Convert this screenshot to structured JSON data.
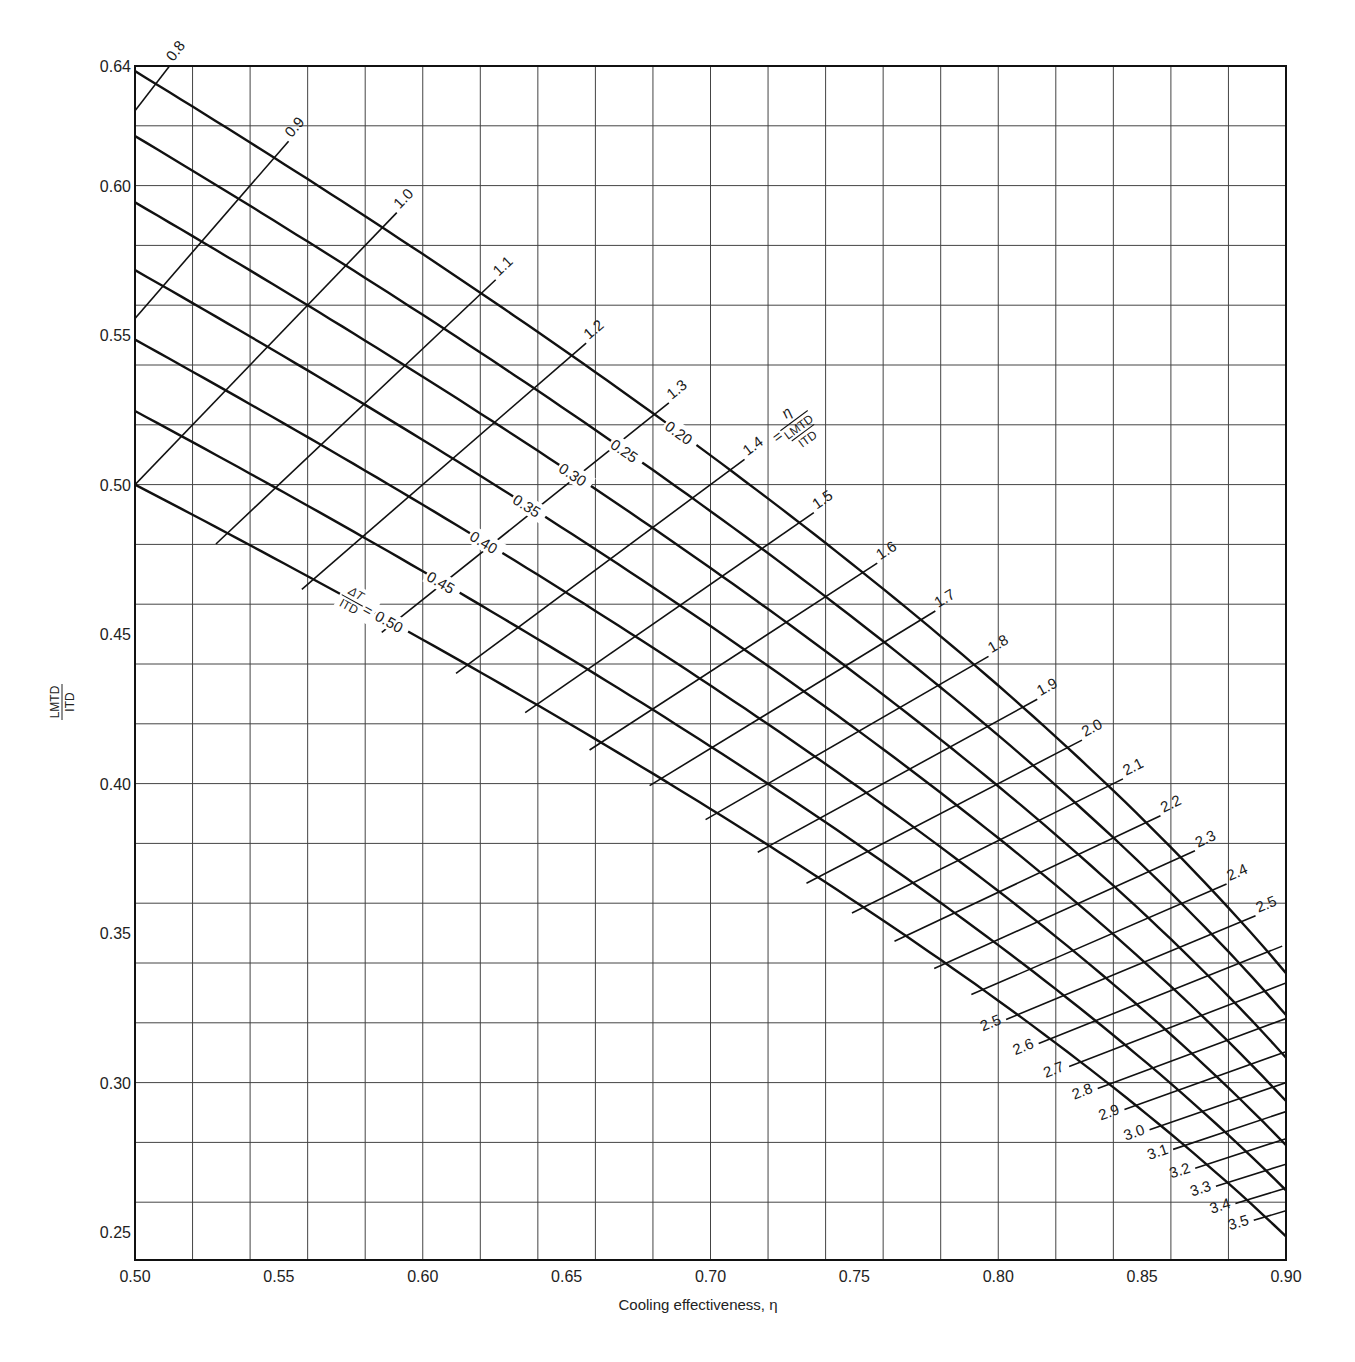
{
  "chart_data": {
    "type": "line",
    "title": "",
    "xlabel": "Cooling effectiveness, η",
    "ylabel": "LMTD / ITD",
    "ylabel_numerator": "LMTD",
    "ylabel_denominator": "ITD",
    "xlim": [
      0.5,
      0.9
    ],
    "ylim": [
      0.2406,
      0.64
    ],
    "grid": true,
    "x_grid_step": 0.02,
    "y_grid_step": 0.02,
    "x_ticks": [
      "0.50",
      "0.55",
      "0.60",
      "0.65",
      "0.70",
      "0.75",
      "0.80",
      "0.85",
      "0.90"
    ],
    "y_ticks": [
      "0.64",
      "0.60",
      "0.55",
      "0.50",
      "0.45",
      "0.40",
      "0.35",
      "0.30",
      "0.25"
    ],
    "legend": "none",
    "relation": "LMTD/ITD = (η − ΔT/ITD) / ln((1 − ΔT/ITD)/(1 − η))",
    "family_dt": {
      "parameter": "ΔT/ITD",
      "prefix_label_numerator": "ΔT",
      "prefix_label_denominator": "ITD",
      "values": [
        0.2,
        0.25,
        0.3,
        0.35,
        0.4,
        0.45,
        0.5
      ],
      "labels": [
        "0.20",
        "0.25",
        "0.30",
        "0.35",
        "0.40",
        "0.45",
        "0.50"
      ],
      "label_eta": [
        0.685,
        0.666,
        0.648,
        0.632,
        0.617,
        0.602,
        0.584
      ],
      "start_values_at_eta_0_50": [
        0.638,
        0.616,
        0.594,
        0.571,
        0.548,
        0.524,
        0.5
      ],
      "end_values_at_eta_0_90": [
        0.337,
        0.322,
        0.308,
        0.293,
        0.279,
        0.263,
        0.249
      ]
    },
    "family_ntu": {
      "parameter": "η / (LMTD/ITD)",
      "equation_label": "1.4 =",
      "equation_numerator": "η",
      "equation_den_top": "LMTD",
      "equation_den_bottom": "ITD",
      "values": [
        0.8,
        0.9,
        1.0,
        1.1,
        1.2,
        1.3,
        1.4,
        1.5,
        1.6,
        1.7,
        1.8,
        1.9,
        2.0,
        2.1,
        2.2,
        2.3,
        2.4,
        2.5,
        2.6,
        2.7,
        2.8,
        2.9,
        3.0,
        3.1,
        3.2,
        3.3,
        3.4,
        3.5
      ],
      "upper_labels": [
        "0.8",
        "0.9",
        "1.0",
        "1.1",
        "1.2",
        "1.3",
        "1.4",
        "1.5",
        "1.6",
        "1.7",
        "1.8",
        "1.9",
        "2.0",
        "2.1",
        "2.2",
        "2.3",
        "2.4",
        "2.5"
      ],
      "lower_labels": [
        "2.5",
        "2.6",
        "2.7",
        "2.8",
        "2.9",
        "3.0",
        "3.1",
        "3.2",
        "3.3",
        "3.4",
        "3.5"
      ]
    }
  }
}
